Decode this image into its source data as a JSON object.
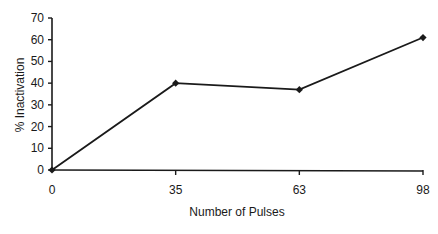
{
  "chart_data": {
    "type": "line",
    "title": "",
    "xlabel": "Number of Pulses",
    "ylabel": "% Inactivation",
    "categories": [
      "0",
      "35",
      "63",
      "98"
    ],
    "series": [
      {
        "name": "% Inactivation",
        "values": [
          0,
          40,
          37,
          61
        ],
        "marker": "diamond",
        "color": "#1a1a1a"
      }
    ],
    "ylim": [
      0,
      70
    ],
    "yticks": [
      0,
      10,
      20,
      30,
      40,
      50,
      60,
      70
    ],
    "xticks": [
      "0",
      "35",
      "63",
      "98"
    ],
    "grid": false,
    "legend": "none"
  },
  "colors": {
    "line": "#1a1a1a",
    "axis": "#1a1a1a",
    "background": "#ffffff"
  }
}
